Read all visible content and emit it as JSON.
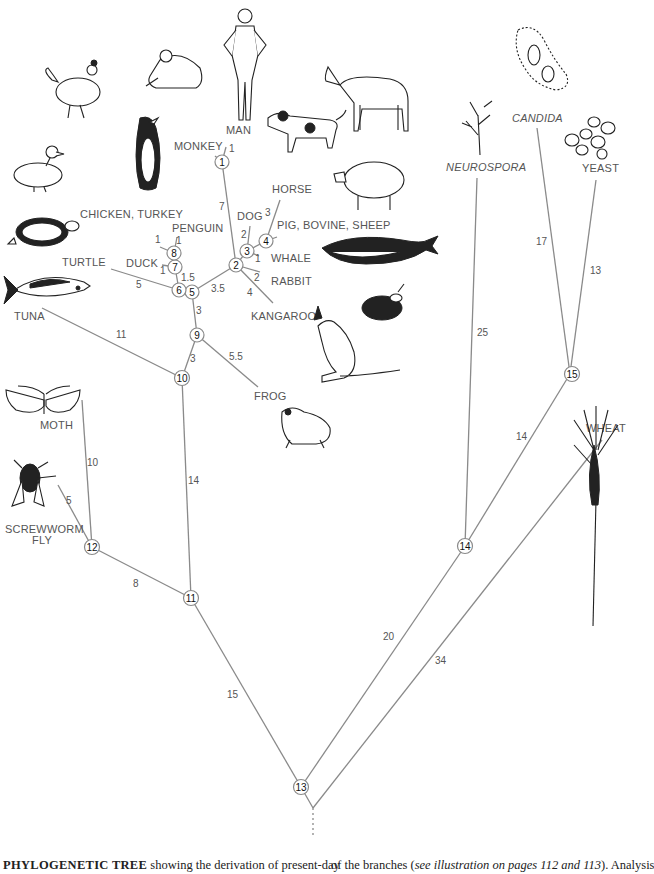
{
  "figure": {
    "title": "PHYLOGENETIC TREE",
    "caption_left_bold": "PHYLOGENETIC TREE",
    "caption_left_rest": " showing the derivation of present-day",
    "caption_right_pre": "of the branches (",
    "caption_right_italic": "see illustration on pages 112 and 113",
    "caption_right_post": "). Analysis"
  },
  "taxa": {
    "man": "MAN",
    "monkey": "MONKEY",
    "horse": "HORSE",
    "dog": "DOG",
    "pig": "PIG, BOVINE, SHEEP",
    "whale": "WHALE",
    "rabbit": "RABBIT",
    "kangaroo": "KANGAROO",
    "chicken": "CHICKEN, TURKEY",
    "penguin": "PENGUIN",
    "duck": "DUCK",
    "turtle": "TURTLE",
    "tuna": "TUNA",
    "frog": "FROG",
    "moth": "MOTH",
    "screwworm1": "SCREWWORM",
    "screwworm2": "FLY",
    "neurospora": "NEUROSPORA",
    "candida": "CANDIDA",
    "yeast": "YEAST",
    "wheat": "WHEAT"
  },
  "nodes": {
    "n1": "1",
    "n2": "2",
    "n3": "3",
    "n4": "4",
    "n5": "5",
    "n6": "6",
    "n7": "7",
    "n8": "8",
    "n9": "9",
    "n10": "10",
    "n11": "11",
    "n12": "12",
    "n13": "13",
    "n14": "14",
    "n15": "15"
  },
  "branch_lengths": {
    "man": "1",
    "monkey_to_2": "7",
    "dog": "2",
    "horse": "3",
    "pig": "1",
    "whale": "1",
    "rabbit": "2",
    "kangaroo": "4",
    "n2_to_5": "3.5",
    "chicken": "1",
    "penguin": "1",
    "duck": "1",
    "n7_to_6": "1.5",
    "turtle": "5",
    "n5_to_9": "3",
    "frog": "5.5",
    "n9_to_10": "3",
    "tuna": "11",
    "n10_to_11": "14",
    "moth": "10",
    "screwworm": "5",
    "n12_to_11": "8",
    "n11_to_13": "15",
    "n14_to_13": "20",
    "wheat": "34",
    "neurospora": "25",
    "n15_to_14": "14",
    "candida": "17",
    "yeast": "13"
  },
  "illustrations": [
    "chicken-icon",
    "monkey-icon",
    "man-icon",
    "horse-icon",
    "dog-icon",
    "penguin-icon",
    "duck-icon",
    "pig-icon",
    "turtle-icon",
    "whale-icon",
    "tuna-icon",
    "rabbit-icon",
    "kangaroo-icon",
    "frog-icon",
    "moth-icon",
    "fly-icon",
    "neurospora-icon",
    "candida-icon",
    "yeast-icon",
    "wheat-icon"
  ]
}
